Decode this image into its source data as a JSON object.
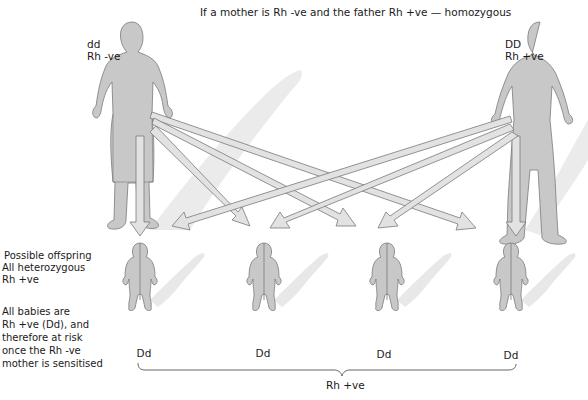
{
  "title": "If a mother is Rh -ve and the father Rh +ve — homozygous",
  "mother": {
    "genotype": "dd",
    "phenotype": "Rh -ve"
  },
  "father": {
    "genotype": "DD",
    "phenotype": "Rh +ve"
  },
  "offspring_note": {
    "line1": "Possible offspring",
    "line2": "All heterozygous",
    "line3": "Rh +ve"
  },
  "risk_note": {
    "line1": "All babies are",
    "line2": "Rh +ve (Dd), and",
    "line3": "therefore at risk",
    "line4": "once the Rh -ve",
    "line5": "mother is sensitised"
  },
  "babies": [
    {
      "genotype": "Dd"
    },
    {
      "genotype": "Dd"
    },
    {
      "genotype": "Dd"
    },
    {
      "genotype": "Dd"
    }
  ],
  "bracket_label": "Rh +ve",
  "colors": {
    "figure_fill": "#c8c8c8",
    "figure_stroke": "#7a7a7a",
    "arrow_fill": "#e2e2e2",
    "shadow": "#e6e6e6"
  }
}
